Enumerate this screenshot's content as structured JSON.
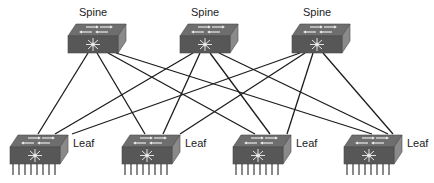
{
  "diagram": {
    "type": "spine-leaf-topology",
    "colors": {
      "background": "#ffffff",
      "link": "#1c1c1c",
      "switch_top": "#6e6e6e",
      "switch_front": "#575757",
      "switch_side": "#8a8a8a",
      "arrow": "#e8e8e8",
      "pin": "#2a2a2a"
    },
    "spines": [
      {
        "id": "spine-1",
        "label": "Spine"
      },
      {
        "id": "spine-2",
        "label": "Spine"
      },
      {
        "id": "spine-3",
        "label": "Spine"
      }
    ],
    "leaves": [
      {
        "id": "leaf-1",
        "label": "Leaf"
      },
      {
        "id": "leaf-2",
        "label": "Leaf"
      },
      {
        "id": "leaf-3",
        "label": "Leaf"
      },
      {
        "id": "leaf-4",
        "label": "Leaf"
      }
    ],
    "links": [
      [
        "spine-1",
        "leaf-1"
      ],
      [
        "spine-1",
        "leaf-2"
      ],
      [
        "spine-1",
        "leaf-3"
      ],
      [
        "spine-1",
        "leaf-4"
      ],
      [
        "spine-2",
        "leaf-1"
      ],
      [
        "spine-2",
        "leaf-2"
      ],
      [
        "spine-2",
        "leaf-3"
      ],
      [
        "spine-2",
        "leaf-4"
      ],
      [
        "spine-3",
        "leaf-1"
      ],
      [
        "spine-3",
        "leaf-2"
      ],
      [
        "spine-3",
        "leaf-3"
      ],
      [
        "spine-3",
        "leaf-4"
      ]
    ]
  }
}
